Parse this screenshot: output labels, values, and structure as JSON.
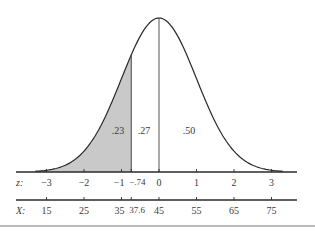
{
  "chart_data": {
    "type": "area",
    "title": "",
    "distribution": {
      "mean": 45,
      "sd": 10
    },
    "shaded_region": {
      "from_z": -3.5,
      "to_z": -0.74,
      "area_label": ".23"
    },
    "area_labels": [
      {
        "label": ".23",
        "region": "z < -.74"
      },
      {
        "label": ".27",
        "region": "-.74 < z < 0"
      },
      {
        "label": ".50",
        "region": "z > 0"
      }
    ],
    "z_axis": {
      "label": "z:",
      "ticks": [
        "−3",
        "−2",
        "−1",
        "−.74",
        "0",
        "1",
        "2",
        "3"
      ],
      "tick_values": [
        -3,
        -2,
        -1,
        -0.74,
        0,
        1,
        2,
        3
      ]
    },
    "x_axis": {
      "label": "X:",
      "ticks": [
        "15",
        "25",
        "35",
        "37.6",
        "45",
        "55",
        "65",
        "75"
      ],
      "tick_values": [
        15,
        25,
        35,
        37.6,
        45,
        55,
        65,
        75
      ]
    },
    "grid": false,
    "legend": null
  },
  "colors": {
    "curve": "#2a2a2a",
    "shade": "#c9c9c9",
    "axis": "#2a2a2a",
    "text": "#3a3a3a"
  }
}
